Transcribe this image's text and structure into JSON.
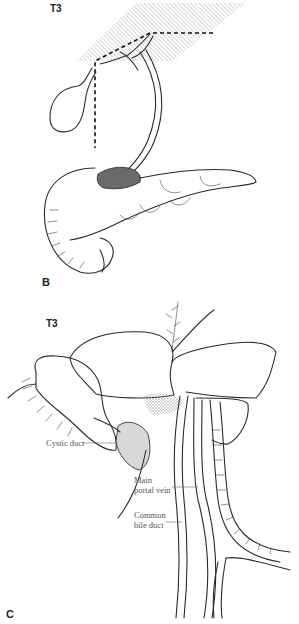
{
  "figure": {
    "panels": [
      {
        "id": "B",
        "letter": "B",
        "stage_label": "T3",
        "structures": [
          "liver (hatched plane)",
          "gallbladder",
          "common bile duct",
          "pancreas",
          "duodenum",
          "tumor"
        ],
        "annotations": []
      },
      {
        "id": "C",
        "letter": "C",
        "stage_label": "T3",
        "structures": [
          "liver lobes",
          "gallbladder",
          "portal vein",
          "bile duct",
          "hepatic artery"
        ],
        "annotations": [
          {
            "label": "Cystic duct"
          },
          {
            "label_line1": "Main",
            "label_line2": "portal vein"
          },
          {
            "label_line1": "Common",
            "label_line2": "bile duct"
          }
        ]
      }
    ],
    "colors": {
      "ink": "#2a2a2a",
      "label": "#555555",
      "tumor": "#6a6a6a",
      "background": "#ffffff"
    }
  }
}
